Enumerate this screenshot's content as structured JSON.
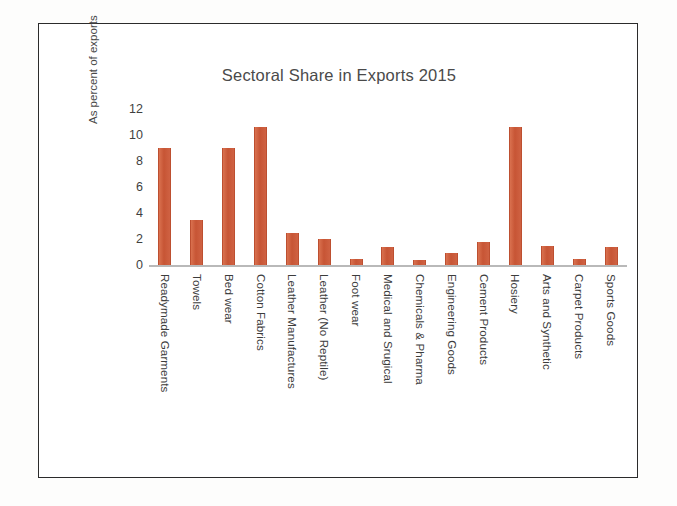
{
  "chart_data": {
    "type": "bar",
    "title": "Sectoral Share in Exports 2015",
    "xlabel": "",
    "ylabel": "As percent of exports",
    "ylim": [
      0,
      12
    ],
    "yticks": [
      "12",
      "10",
      "8",
      "6",
      "4",
      "2",
      "0"
    ],
    "ytick_values": [
      12,
      10,
      8,
      6,
      4,
      2,
      0
    ],
    "grid": false,
    "legend": "none",
    "bar_color": "#C75535",
    "axis_color": "#B9B9B9",
    "categories": [
      "Readymade Garments",
      "Towels",
      "Bed wear",
      "Cotton Fabrics",
      "Leather Manufactures",
      "Leather (No Reptile)",
      "Foot wear",
      "Medical and Srugical",
      "Chemicals & Pharma",
      "Engineering Goods",
      "Cement Products",
      "Hosiery",
      "Arts and Synthetic",
      "Carpet Products",
      "Sports Goods"
    ],
    "values": [
      9.0,
      3.5,
      9.0,
      10.6,
      2.5,
      2.0,
      0.45,
      1.4,
      0.35,
      0.9,
      1.8,
      10.6,
      1.5,
      0.45,
      1.4
    ]
  }
}
